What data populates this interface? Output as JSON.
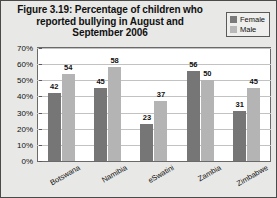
{
  "figure": {
    "title": "Figure 3.19: Percentage of children who reported bullying in August and September 2006"
  },
  "legend": {
    "position": "top-right",
    "entries": [
      {
        "label": "Female",
        "color": "#7a7a7a",
        "icon": "legend-swatch"
      },
      {
        "label": "Male",
        "color": "#b8b8b8",
        "icon": "legend-swatch"
      }
    ]
  },
  "axes": {
    "yticks": [
      "0%",
      "10%",
      "20%",
      "30%",
      "40%",
      "50%",
      "60%",
      "70%"
    ]
  },
  "chart_data": {
    "type": "bar",
    "title": "Figure 3.19: Percentage of children who reported bullying in August and September 2006",
    "xlabel": "",
    "ylabel": "",
    "ylim": [
      0,
      70
    ],
    "ytick_step": 10,
    "grid": true,
    "legend_position": "top-right",
    "categories": [
      "Botswana",
      "Namibia",
      "eSwatini",
      "Zambia",
      "Zimbabwe"
    ],
    "series": [
      {
        "name": "Female",
        "color": "#767676",
        "values": [
          42,
          45,
          23,
          56,
          31
        ]
      },
      {
        "name": "Male",
        "color": "#b4b4b4",
        "values": [
          54,
          58,
          37,
          50,
          45
        ]
      }
    ]
  }
}
